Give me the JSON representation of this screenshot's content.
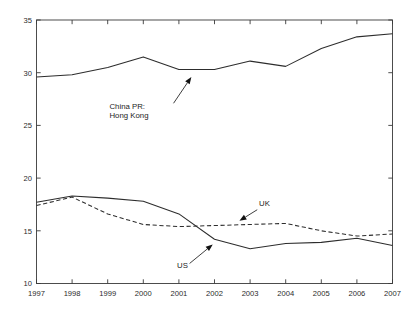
{
  "chart_data": {
    "type": "line",
    "title": "",
    "subtitle": "",
    "xlabel": "",
    "ylabel": "",
    "x": [
      1997,
      1998,
      1999,
      2000,
      2001,
      2002,
      2003,
      2004,
      2005,
      2006,
      2007
    ],
    "xlim": [
      1997,
      2007
    ],
    "ylim": [
      10,
      35
    ],
    "xticks": [
      "1997",
      "1998",
      "1999",
      "2000",
      "2001",
      "2002",
      "2003",
      "2004",
      "2005",
      "2006",
      "2007"
    ],
    "yticks": [
      "10",
      "15",
      "20",
      "25",
      "30",
      "35"
    ],
    "grid": false,
    "legend": "none",
    "legend_position": "inline-annotations",
    "series": [
      {
        "name": "China PR: Hong Kong",
        "style": "solid",
        "color": "#2d2d2d",
        "values": [
          29.6,
          29.8,
          30.5,
          31.5,
          30.3,
          30.3,
          31.1,
          30.6,
          32.3,
          33.4,
          33.7
        ]
      },
      {
        "name": "US",
        "style": "solid",
        "color": "#2d2d2d",
        "values": [
          17.7,
          18.3,
          18.1,
          17.8,
          16.6,
          14.2,
          13.3,
          13.8,
          13.9,
          14.3,
          13.6
        ]
      },
      {
        "name": "UK",
        "style": "dashed",
        "color": "#2d2d2d",
        "values": [
          17.4,
          18.2,
          16.6,
          15.6,
          15.4,
          15.5,
          15.6,
          15.7,
          15.0,
          14.5,
          14.7
        ]
      }
    ],
    "annotations": [
      {
        "id": "china-hk-annotation",
        "text_lines": [
          "China PR:",
          "Hong Kong"
        ],
        "text_x": 1999.05,
        "text_y": 26.6,
        "arrow_from_x": 2000.85,
        "arrow_from_y": 27.1,
        "arrow_to_x": 2001.35,
        "arrow_to_y": 29.6
      },
      {
        "id": "us-annotation",
        "text_lines": [
          "US"
        ],
        "text_x": 2000.95,
        "text_y": 11.45,
        "arrow_from_x": 2001.3,
        "arrow_from_y": 11.9,
        "arrow_to_x": 2001.95,
        "arrow_to_y": 13.7
      },
      {
        "id": "uk-annotation",
        "text_lines": [
          "UK"
        ],
        "text_x": 2003.25,
        "text_y": 17.35,
        "arrow_from_x": 2003.2,
        "arrow_from_y": 17.0,
        "arrow_to_x": 2002.7,
        "arrow_to_y": 15.95
      }
    ]
  }
}
